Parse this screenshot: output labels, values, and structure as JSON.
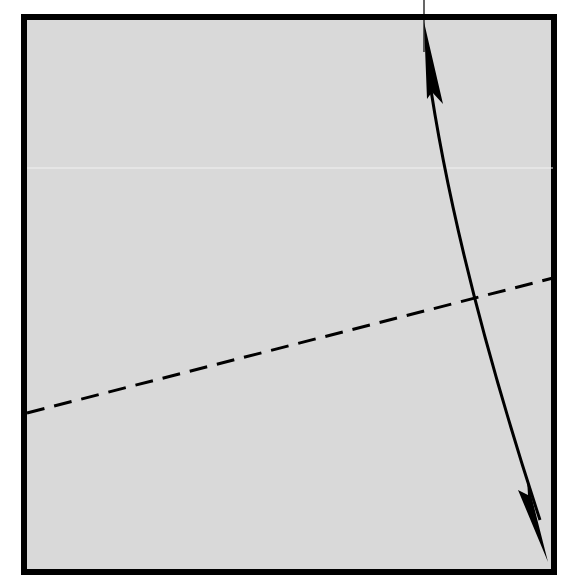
{
  "diagram": {
    "type": "origami-fold-step",
    "colors": {
      "background": "#ffffff",
      "paper": "#d9d9d9",
      "stroke": "#000000",
      "artifact_line": "#f2f2f2"
    },
    "paper_square": {
      "x": 24,
      "y": 17,
      "width": 530,
      "height": 555,
      "border_width": 6
    },
    "valley_fold_line": {
      "style": "dashed",
      "from": [
        27,
        413
      ],
      "to": [
        553,
        278
      ]
    },
    "fold_arrow": {
      "style": "double-headed curved arrow",
      "start": [
        424,
        22
      ],
      "end": [
        548,
        562
      ],
      "heads": [
        "top",
        "bottom"
      ]
    },
    "reference_tick": {
      "from": [
        424,
        0
      ],
      "to": [
        424,
        52
      ]
    }
  }
}
